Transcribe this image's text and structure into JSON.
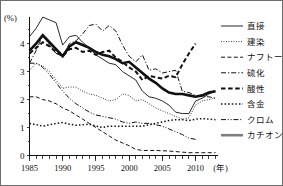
{
  "chart_data": {
    "type": "line",
    "title": "",
    "xlabel": "年",
    "ylabel": "(%)",
    "xlim": [
      1985,
      2013
    ],
    "ylim": [
      0,
      4.9
    ],
    "yticks": [
      0,
      1,
      2,
      3,
      4
    ],
    "ytick_labels": [
      "0",
      "1",
      "2",
      "3",
      "4"
    ],
    "xticks": [
      1985,
      1990,
      1995,
      2000,
      2005,
      2010
    ],
    "xtick_labels": [
      "1985",
      "1990",
      "1995",
      "2000",
      "2005",
      "2010"
    ],
    "minor_xtick_step": 1,
    "grid": false,
    "legend_position": "right",
    "x": [
      1985,
      1986,
      1987,
      1988,
      1989,
      1990,
      1991,
      1992,
      1993,
      1994,
      1995,
      1996,
      1997,
      1998,
      1999,
      2000,
      2001,
      2002,
      2003,
      2004,
      2005,
      2006,
      2007,
      2008,
      2009,
      2010,
      2011,
      2012,
      2013
    ],
    "series": [
      {
        "name": "直接",
        "style": "solid-thin",
        "color": "#111111",
        "values": [
          4.25,
          4.55,
          4.95,
          4.85,
          4.75,
          3.95,
          4.25,
          4.3,
          4.05,
          3.85,
          3.6,
          3.45,
          3.3,
          3.25,
          3.0,
          2.85,
          2.7,
          2.3,
          2.1,
          2.05,
          1.95,
          1.8,
          1.55,
          1.5,
          1.5,
          1.95,
          2.05,
          2.2,
          2.3
        ]
      },
      {
        "name": "建染",
        "style": "dotted-fine",
        "color": "#111111",
        "values": [
          3.05,
          3.3,
          3.2,
          3.0,
          2.7,
          2.4,
          2.45,
          2.45,
          2.3,
          2.2,
          2.15,
          2.05,
          1.95,
          2.0,
          2.2,
          2.15,
          1.95,
          2.0,
          1.85,
          1.7,
          1.6,
          1.5,
          1.4,
          1.3,
          1.35,
          1.8,
          1.95,
          2.0,
          2.05
        ]
      },
      {
        "name": "ナフトール",
        "style": "dashed-medium",
        "color": "#111111",
        "values": [
          2.1,
          2.1,
          2.0,
          1.95,
          1.85,
          1.7,
          1.6,
          1.45,
          1.3,
          1.15,
          1.0,
          0.85,
          0.7,
          0.55,
          0.45,
          0.35,
          0.22,
          0.18,
          0.18,
          0.18,
          0.17,
          0.16,
          0.14,
          0.12,
          0.1,
          0.1,
          0.1,
          0.1,
          0.1
        ]
      },
      {
        "name": "硫化",
        "style": "dashdot",
        "color": "#111111",
        "values": [
          3.3,
          3.75,
          4.3,
          3.95,
          3.65,
          3.55,
          4.0,
          4.1,
          4.35,
          4.65,
          4.7,
          4.45,
          4.65,
          4.45,
          3.95,
          3.55,
          3.35,
          3.6,
          3.05,
          3.1,
          2.95,
          3.0,
          3.05,
          2.3,
          2.25,
          2.15,
          2.1,
          2.1,
          2.05
        ]
      },
      {
        "name": "酸性",
        "style": "dashed-thick",
        "color": "#111111",
        "values": [
          3.65,
          3.85,
          4.05,
          3.9,
          3.7,
          3.55,
          3.8,
          3.85,
          3.7,
          3.75,
          3.6,
          3.7,
          3.75,
          3.5,
          3.35,
          3.15,
          3.0,
          2.7,
          2.85,
          2.8,
          2.75,
          2.85,
          2.8,
          3.25,
          3.65,
          4.0,
          null,
          null,
          null
        ]
      },
      {
        "name": "含金",
        "style": "dotted-bold",
        "color": "#111111",
        "values": [
          1.15,
          1.1,
          1.05,
          1.1,
          1.15,
          1.18,
          1.12,
          1.08,
          1.1,
          1.12,
          1.05,
          1.0,
          1.05,
          1.05,
          1.05,
          1.05,
          1.05,
          1.05,
          1.1,
          1.15,
          1.2,
          1.25,
          1.28,
          1.28,
          1.25,
          1.3,
          1.32,
          1.3,
          1.28
        ]
      },
      {
        "name": "クロム",
        "style": "dash-dotdot",
        "color": "#111111",
        "values": [
          3.3,
          3.3,
          3.15,
          2.9,
          2.6,
          2.3,
          2.05,
          1.85,
          1.7,
          1.55,
          1.45,
          1.4,
          1.35,
          1.3,
          1.2,
          1.15,
          1.2,
          1.15,
          1.15,
          1.1,
          1.05,
          0.95,
          0.85,
          0.75,
          0.62,
          0.58,
          null,
          null,
          null
        ]
      },
      {
        "name": "カチオン",
        "style": "solid-thick-gray",
        "color": "#7f7f7f",
        "values": [
          3.75,
          4.0,
          4.3,
          4.05,
          3.8,
          3.55,
          3.9,
          4.05,
          3.95,
          3.85,
          3.7,
          3.6,
          3.55,
          3.45,
          3.3,
          3.35,
          3.15,
          2.95,
          2.75,
          2.6,
          2.4,
          2.25,
          2.2,
          2.2,
          2.15,
          2.1,
          2.15,
          2.25,
          2.3
        ]
      }
    ]
  }
}
